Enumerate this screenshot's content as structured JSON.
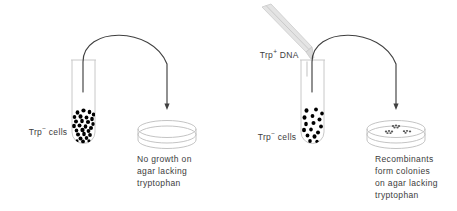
{
  "figure": {
    "background_color": "#ffffff",
    "ink_color": "#3c3c3c",
    "line_color": "#404040",
    "cell_color": "#000000",
    "pipette_color": "#d2d2d2"
  },
  "panels": [
    {
      "id": "control",
      "tube_label": "Trp",
      "tube_label_sup": "−",
      "tube_label_suffix": " cells",
      "dna_label": null,
      "dish_state": "empty",
      "caption_lines": [
        "No growth on",
        "agar lacking",
        "tryptophan"
      ]
    },
    {
      "id": "transformation",
      "tube_label": "Trp",
      "tube_label_sup": "−",
      "tube_label_suffix": " cells",
      "dna_label": "Trp",
      "dna_label_sup": "+",
      "dna_label_suffix": " DNA",
      "dish_state": "colonies",
      "colony_count": 3,
      "caption_lines": [
        "Recombinants",
        "form colonies",
        "on agar lacking",
        "tryptophan"
      ]
    }
  ]
}
